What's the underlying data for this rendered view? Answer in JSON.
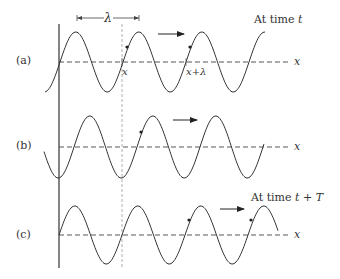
{
  "figure": {
    "panels": [
      {
        "id": "a",
        "label": "(a)",
        "caption": "At time ",
        "caption_var": "t",
        "axis_label": "x",
        "points": [
          {
            "label": "x"
          },
          {
            "label": "x+λ"
          }
        ]
      },
      {
        "id": "b",
        "label": "(b)",
        "axis_label": "x"
      },
      {
        "id": "c",
        "label": "(c)",
        "caption": "At time ",
        "caption_var": "t + T",
        "axis_label": "x"
      }
    ],
    "wavelength_label": "λ",
    "colors": {
      "wave": "#333333",
      "axis": "#444444",
      "guide": "#999999"
    }
  }
}
